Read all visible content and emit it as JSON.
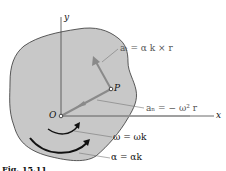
{
  "diagram": {
    "labels": {
      "y_axis": "y",
      "x_axis": "x",
      "origin": "O",
      "point": "P",
      "a_t": "aₜ = α k × r",
      "a_n": "aₙ = − ω² r",
      "omega": "ω = ωk",
      "alpha": "α = αk"
    },
    "caption": "Fig. 15.11",
    "colors": {
      "body_fill": "#c8c8c8",
      "body_stroke": "#333333",
      "vector": "#8a8a8a",
      "axis": "#444444",
      "label": "#555555"
    }
  }
}
